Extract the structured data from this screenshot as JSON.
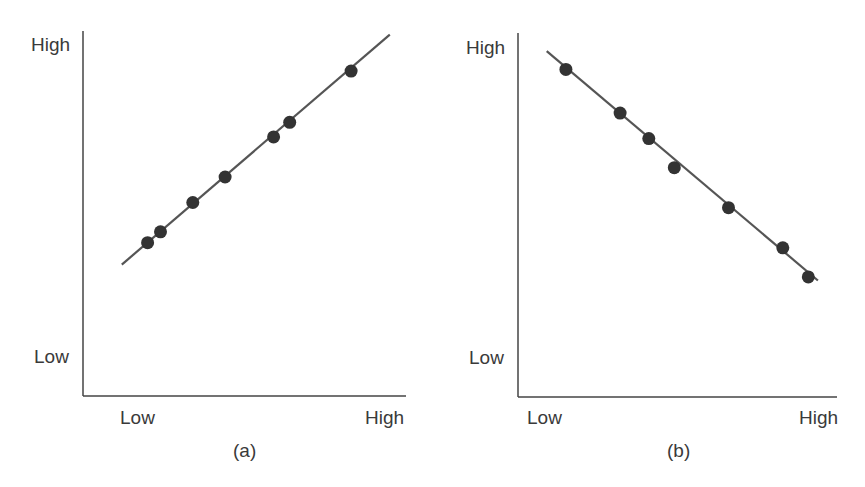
{
  "chart_data": [
    {
      "type": "scatter",
      "panel_label": "(a)",
      "title": "",
      "xlabel": "",
      "ylabel": "",
      "x_tick_labels": [
        "Low",
        "High"
      ],
      "y_tick_labels": [
        "Low",
        "High"
      ],
      "grid": false,
      "legend": null,
      "trend": "positive linear",
      "fit_line": {
        "x": [
          0.12,
          0.95
        ],
        "y": [
          0.36,
          0.99
        ]
      },
      "x": [
        0.2,
        0.24,
        0.34,
        0.44,
        0.59,
        0.64,
        0.83
      ],
      "y": [
        0.42,
        0.45,
        0.53,
        0.6,
        0.71,
        0.75,
        0.89
      ]
    },
    {
      "type": "scatter",
      "panel_label": "(b)",
      "title": "",
      "xlabel": "",
      "ylabel": "",
      "x_tick_labels": [
        "Low",
        "High"
      ],
      "y_tick_labels": [
        "Low",
        "High"
      ],
      "grid": false,
      "legend": null,
      "trend": "negative linear",
      "fit_line": {
        "x": [
          0.09,
          0.94
        ],
        "y": [
          0.95,
          0.32
        ]
      },
      "x": [
        0.15,
        0.32,
        0.41,
        0.49,
        0.66,
        0.83,
        0.91
      ],
      "y": [
        0.9,
        0.78,
        0.71,
        0.63,
        0.52,
        0.41,
        0.33
      ]
    }
  ],
  "panels": [
    {
      "id": "a",
      "caption": "(a)",
      "y_high": "High",
      "y_low": "Low",
      "x_low": "Low",
      "x_high": "High"
    },
    {
      "id": "b",
      "caption": "(b)",
      "y_high": "High",
      "y_low": "Low",
      "x_low": "Low",
      "x_high": "High"
    }
  ],
  "colors": {
    "axis": "#444444",
    "line": "#555555",
    "point": "#333333",
    "text": "#3a3a3a"
  }
}
